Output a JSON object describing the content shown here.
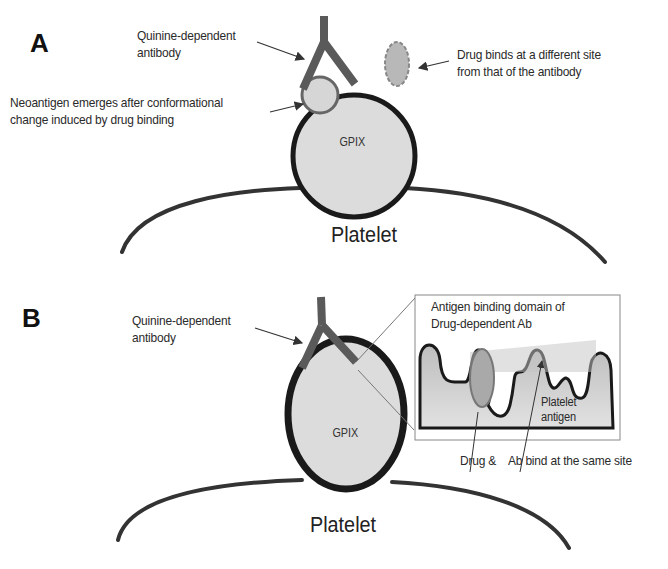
{
  "panel_a": {
    "label": "A",
    "antibody_label_1": "Quinine-dependent",
    "antibody_label_2": "antibody",
    "drug_label_1": "Drug binds at a different site",
    "drug_label_2": "from that of the antibody",
    "neoantigen_label_1": "Neoantigen emerges after conformational",
    "neoantigen_label_2": "change induced by drug binding",
    "receptor_label": "GPIX",
    "cell_label": "Platelet"
  },
  "panel_b": {
    "label": "B",
    "antibody_label_1": "Quinine-dependent",
    "antibody_label_2": "antibody",
    "inset_title_1": "Antigen binding domain of",
    "inset_title_2": "Drug-dependent Ab",
    "platelet_antigen_1": "Platelet",
    "platelet_antigen_2": "antigen",
    "drug_ab_label_1": "Drug &",
    "drug_ab_label_2": "Ab bind at the same site",
    "receptor_label": "GPIX",
    "cell_label": "Platelet"
  },
  "colors": {
    "outline": "#1a1a1a",
    "antibody": "#5a5a5a",
    "receptor_fill": "#dcdcdc",
    "drug_fill": "#b8b8b8",
    "inset_fill": "#cfcfcf"
  }
}
